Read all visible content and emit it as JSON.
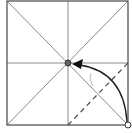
{
  "diagram": {
    "type": "origami-fold-step",
    "square": {
      "x": 7,
      "y": 1,
      "size": 121,
      "stroke": "#555555"
    },
    "crease_color": "#8a8a8a",
    "creases": [
      {
        "name": "vertical-center-crease",
        "x1": 68,
        "y1": 1,
        "x2": 68,
        "y2": 125
      },
      {
        "name": "horizontal-center-crease",
        "x1": 7,
        "y1": 63,
        "x2": 128,
        "y2": 63
      },
      {
        "name": "diagonal-crease-tl-br",
        "x1": 7,
        "y1": 1,
        "x2": 128,
        "y2": 125
      },
      {
        "name": "diagonal-crease-tr-bl",
        "x1": 128,
        "y1": 1,
        "x2": 7,
        "y2": 125
      }
    ],
    "valley_fold_line": {
      "x1": 68,
      "y1": 125,
      "x2": 128,
      "y2": 63,
      "color": "#444444"
    },
    "arrow": {
      "from": [
        128,
        123
      ],
      "to": [
        72,
        64
      ],
      "color": "#222222"
    },
    "target_point": {
      "x": 68,
      "y": 63,
      "r": 3,
      "fill": "#666666"
    },
    "source_point": {
      "x": 128,
      "y": 125,
      "r": 3,
      "fill": "#ffffff"
    },
    "hint_mark_color": "#d0d0d0"
  }
}
